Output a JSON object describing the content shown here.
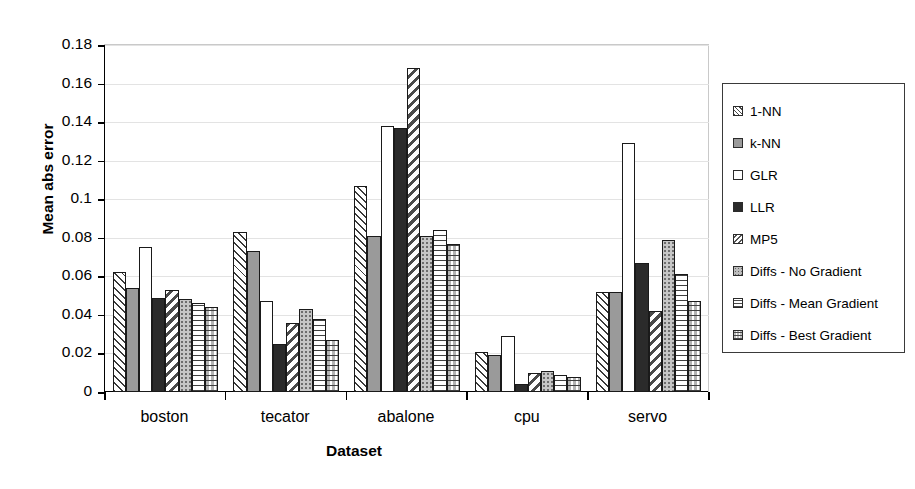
{
  "chart_data": {
    "type": "bar",
    "title": "",
    "xlabel": "Dataset",
    "ylabel": "Mean abs error",
    "categories": [
      "boston",
      "tecator",
      "abalone",
      "cpu",
      "servo"
    ],
    "ylim": [
      0,
      0.18
    ],
    "ytick_labels": [
      "0",
      "0.02",
      "0.04",
      "0.06",
      "0.08",
      "0.1",
      "0.12",
      "0.14",
      "0.16",
      "0.18"
    ],
    "ytick_values": [
      0,
      0.02,
      0.04,
      0.06,
      0.08,
      0.1,
      0.12,
      0.14,
      0.16,
      0.18
    ],
    "grid": true,
    "legend_position": "right",
    "series": [
      {
        "name": "1-NN",
        "pattern": "diagonal-thin",
        "values": [
          0.062,
          0.083,
          0.107,
          0.021,
          0.052
        ]
      },
      {
        "name": "k-NN",
        "pattern": "solid-gray",
        "values": [
          0.054,
          0.073,
          0.081,
          0.019,
          0.052
        ]
      },
      {
        "name": "GLR",
        "pattern": "white",
        "values": [
          0.075,
          0.047,
          0.138,
          0.029,
          0.129
        ]
      },
      {
        "name": "LLR",
        "pattern": "solid-dark",
        "values": [
          0.049,
          0.025,
          0.137,
          0.004,
          0.067
        ]
      },
      {
        "name": "MP5",
        "pattern": "diagonal-thick",
        "values": [
          0.053,
          0.036,
          0.168,
          0.01,
          0.042
        ]
      },
      {
        "name": "Diffs - No Gradient",
        "pattern": "dots",
        "values": [
          0.048,
          0.043,
          0.081,
          0.011,
          0.079
        ]
      },
      {
        "name": "Diffs - Mean Gradient",
        "pattern": "horizontal",
        "values": [
          0.046,
          0.038,
          0.084,
          0.009,
          0.061
        ]
      },
      {
        "name": "Diffs - Best Gradient",
        "pattern": "checker",
        "values": [
          0.044,
          0.027,
          0.077,
          0.008,
          0.047
        ]
      }
    ]
  }
}
